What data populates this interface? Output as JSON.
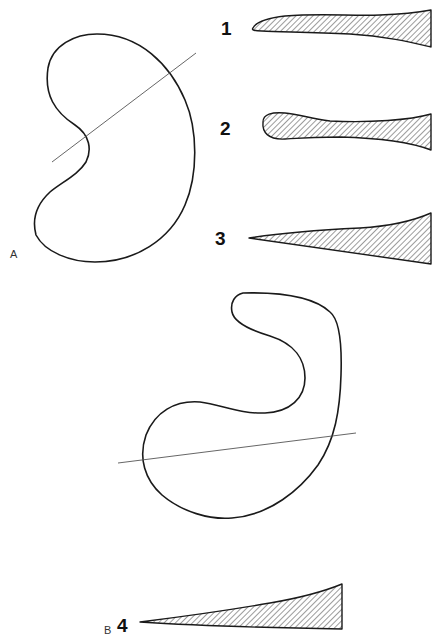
{
  "panels": {
    "a": {
      "label": "A"
    },
    "b": {
      "label": "B"
    }
  },
  "profiles": [
    {
      "label": "1",
      "description": "blunt rounded tip, tapering body"
    },
    {
      "label": "2",
      "description": "bulbous rounded tip, narrow neck"
    },
    {
      "label": "3",
      "description": "sharp pointed tip, wedge"
    },
    {
      "label": "4",
      "description": "sharp pointed tip, long wedge"
    }
  ],
  "colors": {
    "ink": "#1a1a1a",
    "section_line": "#555555",
    "background": "#ffffff"
  }
}
